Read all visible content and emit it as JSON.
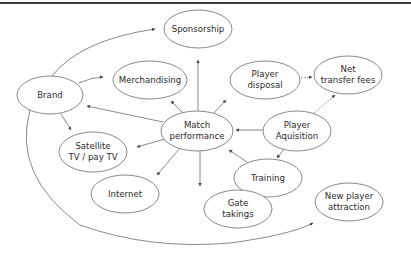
{
  "diagram": {
    "type": "flow-diagram",
    "nodes": [
      {
        "id": "sponsorship",
        "label_lines": [
          "Sponsorship"
        ],
        "cx": 198,
        "cy": 29,
        "rx": 34,
        "ry": 19
      },
      {
        "id": "brand",
        "label_lines": [
          "Brand"
        ],
        "cx": 50,
        "cy": 95,
        "rx": 33,
        "ry": 19
      },
      {
        "id": "merchandising",
        "label_lines": [
          "Merchandising"
        ],
        "cx": 150,
        "cy": 80,
        "rx": 37,
        "ry": 19
      },
      {
        "id": "player-disposal",
        "label_lines": [
          "Player",
          "disposal"
        ],
        "cx": 265,
        "cy": 80,
        "rx": 35,
        "ry": 19
      },
      {
        "id": "net-transfer-fees",
        "label_lines": [
          "Net",
          "transfer fees"
        ],
        "cx": 348,
        "cy": 75,
        "rx": 34,
        "ry": 19
      },
      {
        "id": "match-performance",
        "label_lines": [
          "Match",
          "performance"
        ],
        "cx": 197,
        "cy": 131,
        "rx": 36,
        "ry": 20
      },
      {
        "id": "player-aquisition",
        "label_lines": [
          "Player",
          "Aquisition"
        ],
        "cx": 297,
        "cy": 131,
        "rx": 34,
        "ry": 20
      },
      {
        "id": "satellite-tv",
        "label_lines": [
          "Satellite",
          "TV / pay TV"
        ],
        "cx": 93,
        "cy": 152,
        "rx": 34,
        "ry": 20
      },
      {
        "id": "training",
        "label_lines": [
          "Training"
        ],
        "cx": 268,
        "cy": 178,
        "rx": 34,
        "ry": 19
      },
      {
        "id": "internet",
        "label_lines": [
          "Internet"
        ],
        "cx": 125,
        "cy": 194,
        "rx": 34,
        "ry": 19
      },
      {
        "id": "gate-takings",
        "label_lines": [
          "Gate",
          "takings"
        ],
        "cx": 238,
        "cy": 209,
        "rx": 34,
        "ry": 19
      },
      {
        "id": "new-player-attraction",
        "label_lines": [
          "New player",
          "attraction"
        ],
        "cx": 349,
        "cy": 202,
        "rx": 34,
        "ry": 19
      }
    ],
    "edges": [
      {
        "from": "match-performance",
        "to": "sponsorship",
        "style": "solid"
      },
      {
        "from": "match-performance",
        "to": "merchandising",
        "style": "solid"
      },
      {
        "from": "match-performance",
        "to": "player-disposal",
        "style": "solid"
      },
      {
        "from": "match-performance",
        "to": "brand",
        "style": "solid"
      },
      {
        "from": "match-performance",
        "to": "satellite-tv",
        "style": "solid"
      },
      {
        "from": "match-performance",
        "to": "internet",
        "style": "solid"
      },
      {
        "from": "match-performance",
        "to": "gate-takings",
        "style": "solid"
      },
      {
        "from": "player-aquisition",
        "to": "match-performance",
        "style": "solid"
      },
      {
        "from": "player-aquisition",
        "to": "training",
        "style": "solid"
      },
      {
        "from": "player-aquisition",
        "to": "net-transfer-fees",
        "style": "dotted"
      },
      {
        "from": "player-disposal",
        "to": "net-transfer-fees",
        "style": "dotted"
      },
      {
        "from": "training",
        "to": "match-performance",
        "style": "solid"
      },
      {
        "from": "brand",
        "to": "sponsorship",
        "style": "solid-curve"
      },
      {
        "from": "brand",
        "to": "merchandising",
        "style": "solid-curve"
      },
      {
        "from": "brand",
        "to": "satellite-tv",
        "style": "solid"
      },
      {
        "from": "brand",
        "to": "new-player-attraction",
        "style": "solid-curve"
      }
    ],
    "colors": {
      "stroke": "#6b6b6b",
      "text": "#2a2a2a",
      "topline": "#3a3a3a",
      "background": "#ffffff"
    }
  }
}
